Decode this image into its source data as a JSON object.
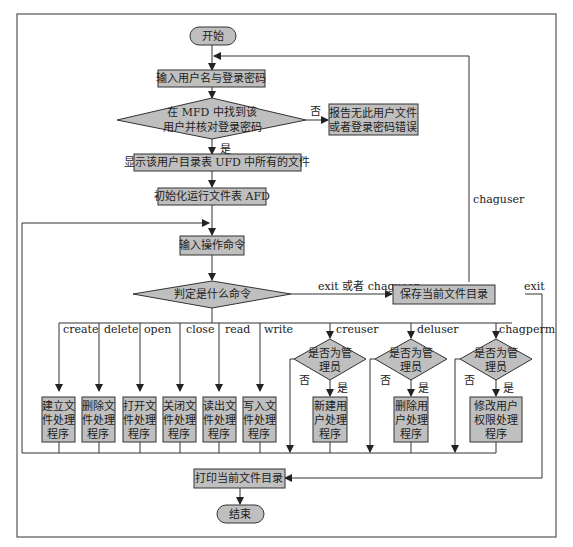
{
  "diagram": {
    "type": "flowchart",
    "colors": {
      "node_fill": "#bfbfbf",
      "stroke": "#3a3a3a",
      "frame": "#555555",
      "background": "#ffffff"
    },
    "nodes": {
      "start": "开始",
      "input_login": "输入用户名与登录密码",
      "check_mfd_line1": "在 MFD 中找到该",
      "check_mfd_line2": "用户并核对登录密码",
      "error_line1": "报告无此用户文件",
      "error_line2": "或者登录密码错误",
      "show_ufd": "显示该用户目录表 UFD 中所有的文件",
      "init_afd": "初始化运行文件表 AFD",
      "input_cmd": "输入操作命令",
      "decide_cmd": "判定是什么命令",
      "save_dir": "保存当前文件目录",
      "print_dir": "打印当前文件目录",
      "end": "结束"
    },
    "edge_labels": {
      "no": "否",
      "yes": "是",
      "exit_or_chaguser": "exit 或者 chaguser",
      "chaguser": "chaguser",
      "exit": "exit"
    },
    "file_commands": [
      {
        "cmd": "create",
        "lines": [
          "建立文",
          "件处理",
          "程序"
        ]
      },
      {
        "cmd": "delete",
        "lines": [
          "删除文",
          "件处理",
          "程序"
        ]
      },
      {
        "cmd": "open",
        "lines": [
          "打开文",
          "件处理",
          "程序"
        ]
      },
      {
        "cmd": "close",
        "lines": [
          "关闭文",
          "件处理",
          "程序"
        ]
      },
      {
        "cmd": "read",
        "lines": [
          "读出文",
          "件处理",
          "程序"
        ]
      },
      {
        "cmd": "write",
        "lines": [
          "写入文",
          "件处理",
          "程序"
        ]
      }
    ],
    "admin_commands": [
      {
        "cmd": "creuser",
        "check": [
          "是否为管",
          "理员"
        ],
        "lines": [
          "新建用",
          "户处理",
          "程序"
        ]
      },
      {
        "cmd": "deluser",
        "check": [
          "是否为管",
          "理员"
        ],
        "lines": [
          "删除用",
          "户处理",
          "程序"
        ]
      },
      {
        "cmd": "chagperm",
        "check": [
          "是否为管",
          "理员"
        ],
        "lines": [
          "修改用户",
          "权限处理",
          "程序"
        ]
      }
    ]
  }
}
